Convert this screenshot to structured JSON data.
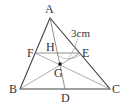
{
  "diagram": {
    "type": "triangle-geometry",
    "points": {
      "A": {
        "label": "A",
        "x": 50,
        "y": 18
      },
      "B": {
        "label": "B",
        "x": 20,
        "y": 89
      },
      "C": {
        "label": "C",
        "x": 110,
        "y": 89
      },
      "D": {
        "label": "D",
        "x": 65,
        "y": 89
      },
      "E": {
        "label": "E",
        "x": 80,
        "y": 53
      },
      "F": {
        "label": "F",
        "x": 35,
        "y": 53
      },
      "G": {
        "label": "G",
        "x": 60,
        "y": 64
      },
      "H": {
        "label": "H",
        "x": 57,
        "y": 53
      }
    },
    "measure_label": "3cm",
    "colors": {
      "line": "#555555",
      "thin": "#888888",
      "text": "#333333"
    }
  }
}
